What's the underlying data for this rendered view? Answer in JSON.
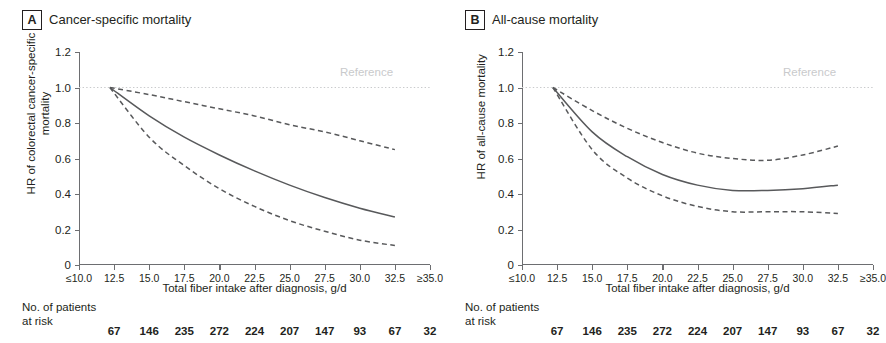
{
  "figure": {
    "x_axis_title": "Total fiber intake after diagnosis, g/d",
    "reference_label": "Reference",
    "risk_label": "No. of patients\nat risk",
    "x_ticks": [
      "≤10.0",
      "12.5",
      "15.0",
      "17.5",
      "20.0",
      "22.5",
      "25.0",
      "27.5",
      "30.0",
      "32.5",
      "≥35.0"
    ],
    "y_ticks": [
      "0",
      "0.2",
      "0.4",
      "0.6",
      "0.8",
      "1.0",
      "1.2"
    ],
    "colors": {
      "axis": "#6d6e71",
      "curve": "#58595b",
      "reference": "#c9cacc",
      "text": "#231f20"
    }
  },
  "panels": [
    {
      "letter": "A",
      "title": "Cancer-specific mortality",
      "y_axis_title": "HR of colorectal cancer-specific\nmortality"
    },
    {
      "letter": "B",
      "title": "All-cause mortality",
      "y_axis_title": "HR of all-cause mortality"
    }
  ],
  "chart_data": [
    {
      "type": "line",
      "title": "Cancer-specific mortality",
      "xlabel": "Total fiber intake after diagnosis, g/d",
      "ylabel": "HR of colorectal cancer-specific mortality",
      "xlim": [
        10.0,
        35.0
      ],
      "ylim": [
        0,
        1.2
      ],
      "yticks": [
        0,
        0.2,
        0.4,
        0.6,
        0.8,
        1.0,
        1.2
      ],
      "xticks": [
        10.0,
        12.5,
        15.0,
        17.5,
        20.0,
        22.5,
        25.0,
        27.5,
        30.0,
        32.5,
        35.0
      ],
      "grid": false,
      "legend": "none",
      "reference_line": {
        "y": 1.0,
        "style": "dotted",
        "label": "Reference"
      },
      "x": [
        12.2,
        15.0,
        17.5,
        20.0,
        22.5,
        25.0,
        27.5,
        30.0,
        32.5
      ],
      "series": [
        {
          "name": "HR",
          "style": "solid",
          "values": [
            1.0,
            0.84,
            0.72,
            0.62,
            0.53,
            0.45,
            0.38,
            0.32,
            0.27
          ]
        },
        {
          "name": "Upper 95% CI",
          "style": "dashed",
          "values": [
            1.0,
            0.96,
            0.92,
            0.88,
            0.84,
            0.79,
            0.75,
            0.7,
            0.65
          ]
        },
        {
          "name": "Lower 95% CI",
          "style": "dashed",
          "values": [
            1.0,
            0.72,
            0.56,
            0.43,
            0.33,
            0.25,
            0.19,
            0.14,
            0.11
          ]
        }
      ],
      "at_risk": {
        "label": "No. of patients at risk",
        "x": [
          12.5,
          15.0,
          17.5,
          20.0,
          22.5,
          25.0,
          27.5,
          30.0,
          32.5,
          35.0
        ],
        "values": [
          67,
          146,
          235,
          272,
          224,
          207,
          147,
          93,
          67,
          32
        ]
      }
    },
    {
      "type": "line",
      "title": "All-cause mortality",
      "xlabel": "Total fiber intake after diagnosis, g/d",
      "ylabel": "HR of all-cause mortality",
      "xlim": [
        10.0,
        35.0
      ],
      "ylim": [
        0,
        1.2
      ],
      "yticks": [
        0,
        0.2,
        0.4,
        0.6,
        0.8,
        1.0,
        1.2
      ],
      "xticks": [
        10.0,
        12.5,
        15.0,
        17.5,
        20.0,
        22.5,
        25.0,
        27.5,
        30.0,
        32.5,
        35.0
      ],
      "grid": false,
      "legend": "none",
      "reference_line": {
        "y": 1.0,
        "style": "dotted",
        "label": "Reference"
      },
      "x": [
        12.2,
        15.0,
        17.5,
        20.0,
        22.5,
        25.0,
        27.5,
        30.0,
        32.5
      ],
      "series": [
        {
          "name": "HR",
          "style": "solid",
          "values": [
            1.0,
            0.75,
            0.61,
            0.51,
            0.45,
            0.42,
            0.42,
            0.43,
            0.45
          ]
        },
        {
          "name": "Upper 95% CI",
          "style": "dashed",
          "values": [
            1.0,
            0.87,
            0.77,
            0.69,
            0.63,
            0.6,
            0.59,
            0.62,
            0.67
          ]
        },
        {
          "name": "Lower 95% CI",
          "style": "dashed",
          "values": [
            1.0,
            0.65,
            0.49,
            0.39,
            0.33,
            0.3,
            0.3,
            0.3,
            0.29
          ]
        }
      ],
      "at_risk": {
        "label": "No. of patients at risk",
        "x": [
          12.5,
          15.0,
          17.5,
          20.0,
          22.5,
          25.0,
          27.5,
          30.0,
          32.5,
          35.0
        ],
        "values": [
          67,
          146,
          235,
          272,
          224,
          207,
          147,
          93,
          67,
          32
        ]
      }
    }
  ]
}
